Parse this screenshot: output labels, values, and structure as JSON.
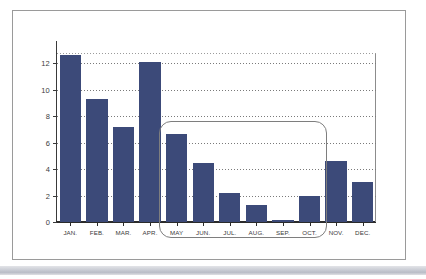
{
  "figure": {
    "frame_color": "#9a9a9a",
    "background": "#ffffff"
  },
  "chart_data": {
    "type": "bar",
    "title": "",
    "subtitle": "",
    "xlabel": "",
    "ylabel": "",
    "categories": [
      "JAN.",
      "FEB.",
      "MAR.",
      "APR.",
      "MAY",
      "JUN.",
      "JUL.",
      "AUG.",
      "SEP.",
      "OCT.",
      "NOV.",
      "DEC."
    ],
    "values": [
      12.6,
      9.3,
      7.2,
      12.1,
      6.65,
      4.45,
      2.2,
      1.3,
      0.15,
      1.95,
      4.6,
      3.0
    ],
    "ylim": [
      0,
      13
    ],
    "yticks": [
      0,
      2,
      4,
      6,
      8,
      10,
      12
    ],
    "ytick_labels": [
      "0",
      "2",
      "4",
      "6",
      "8",
      "10",
      "12"
    ],
    "gridlines": "horizontal-dotted",
    "grid": true,
    "legend": false,
    "legend_position": "none",
    "bar_color": "#3c4a79",
    "annotations": [
      {
        "type": "rounded-rectangle-highlight",
        "label": "",
        "covers": [
          "MAY",
          "JUN.",
          "JUL.",
          "AUG.",
          "SEP.",
          "OCT."
        ],
        "color": "#7e7e7e"
      }
    ]
  }
}
